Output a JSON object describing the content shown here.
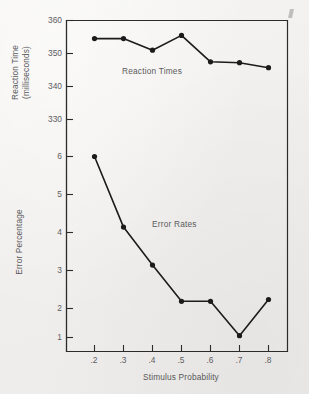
{
  "figure": {
    "background_color": "#f3f2f0",
    "ink_color": "#1b1b1b",
    "text_color": "#5a5a5c"
  },
  "chart_data": {
    "type": "line",
    "title": "",
    "xlabel": "Stimulus Probability",
    "x": [
      0.2,
      0.3,
      0.4,
      0.5,
      0.6,
      0.7,
      0.8
    ],
    "xtick_labels": [
      ".2",
      ".3",
      ".4",
      ".5",
      ".6",
      ".7",
      ".8"
    ],
    "xlim": [
      0.15,
      0.85
    ],
    "grid": false,
    "legend": "inline-annotations",
    "panels": [
      {
        "name": "reaction-times",
        "annotation": "Reaction Times",
        "ylabel": "Reaction Time (milliseconds)",
        "ylabel_line1": "Reaction Time",
        "ylabel_line2": "(milliseconds)",
        "ytick_labels": [
          "360",
          "350",
          "340",
          "330"
        ],
        "ytick_values": [
          360,
          350,
          340,
          330
        ],
        "ylim": [
          326,
          361
        ],
        "values": [
          354.5,
          354.5,
          351.0,
          355.5,
          347.5,
          347.2,
          345.7
        ],
        "marker": "filled-circle"
      },
      {
        "name": "error-rates",
        "annotation": "Error Rates",
        "ylabel": "Error Percentage",
        "ytick_labels": [
          "6",
          "5",
          "4",
          "3",
          "2",
          "1"
        ],
        "ytick_values": [
          6,
          5,
          4,
          3,
          2,
          1
        ],
        "ylim": [
          0.3,
          6.4
        ],
        "values": [
          6.0,
          4.05,
          3.0,
          2.0,
          2.0,
          1.05,
          2.05
        ],
        "marker": "filled-circle"
      }
    ]
  }
}
